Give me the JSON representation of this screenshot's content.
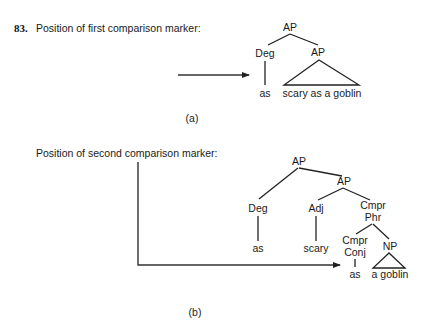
{
  "example": {
    "number": "83.",
    "part_a": {
      "caption": "Position of first comparison marker:",
      "label": "(a)",
      "tree": {
        "root": "AP",
        "left": {
          "label": "Deg",
          "leaf": "as"
        },
        "right": {
          "label": "AP",
          "triangle_leaf": "scary as a goblin"
        }
      }
    },
    "part_b": {
      "caption": "Position of second comparison marker:",
      "label": "(b)",
      "tree": {
        "root": "AP",
        "deg": {
          "label": "Deg",
          "leaf": "as"
        },
        "ap": "AP",
        "adj": {
          "label": "Adj",
          "leaf": "scary"
        },
        "cmpr_phr": {
          "label_line1": "Cmpr",
          "label_line2": "Phr"
        },
        "cmpr_conj": {
          "label_line1": "Cmpr",
          "label_line2": "Conj",
          "leaf": "as"
        },
        "np": {
          "label": "NP",
          "triangle_leaf": "a goblin"
        }
      }
    }
  },
  "colors": {
    "background": "#ffffff",
    "text": "#1a1a1a",
    "lines": "#222222"
  }
}
